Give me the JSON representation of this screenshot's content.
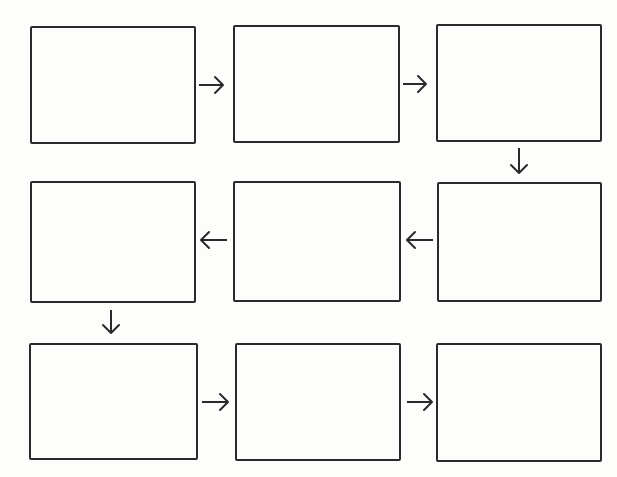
{
  "diagram": {
    "type": "flowchart",
    "layout": "3x3 serpentine grid",
    "stroke_color": "#2a2a2a",
    "background_color": "#fdfdfb",
    "boxes": [
      {
        "id": 1,
        "row": 1,
        "col": 1,
        "label": "",
        "x": 30,
        "y": 26,
        "w": 166,
        "h": 118
      },
      {
        "id": 2,
        "row": 1,
        "col": 2,
        "label": "",
        "x": 233,
        "y": 25,
        "w": 167,
        "h": 118
      },
      {
        "id": 3,
        "row": 1,
        "col": 3,
        "label": "",
        "x": 436,
        "y": 24,
        "w": 166,
        "h": 118
      },
      {
        "id": 4,
        "row": 2,
        "col": 1,
        "label": "",
        "x": 30,
        "y": 181,
        "w": 166,
        "h": 122
      },
      {
        "id": 5,
        "row": 2,
        "col": 2,
        "label": "",
        "x": 233,
        "y": 181,
        "w": 168,
        "h": 121
      },
      {
        "id": 6,
        "row": 2,
        "col": 3,
        "label": "",
        "x": 437,
        "y": 182,
        "w": 165,
        "h": 120
      },
      {
        "id": 7,
        "row": 3,
        "col": 1,
        "label": "",
        "x": 29,
        "y": 343,
        "w": 169,
        "h": 117
      },
      {
        "id": 8,
        "row": 3,
        "col": 2,
        "label": "",
        "x": 235,
        "y": 343,
        "w": 166,
        "h": 118
      },
      {
        "id": 9,
        "row": 3,
        "col": 3,
        "label": "",
        "x": 436,
        "y": 343,
        "w": 166,
        "h": 119
      }
    ],
    "arrows": [
      {
        "from": 1,
        "to": 2,
        "direction": "right",
        "x1": 199,
        "y1": 85,
        "x2": 223,
        "y2": 85
      },
      {
        "from": 2,
        "to": 3,
        "direction": "right",
        "x1": 403,
        "y1": 84,
        "x2": 426,
        "y2": 84
      },
      {
        "from": 3,
        "to": 6,
        "direction": "down",
        "x1": 519,
        "y1": 148,
        "x2": 519,
        "y2": 173
      },
      {
        "from": 6,
        "to": 5,
        "direction": "left",
        "x1": 433,
        "y1": 240,
        "x2": 407,
        "y2": 240
      },
      {
        "from": 5,
        "to": 4,
        "direction": "left",
        "x1": 227,
        "y1": 240,
        "x2": 201,
        "y2": 240
      },
      {
        "from": 4,
        "to": 7,
        "direction": "down",
        "x1": 111,
        "y1": 310,
        "x2": 111,
        "y2": 333
      },
      {
        "from": 7,
        "to": 8,
        "direction": "right",
        "x1": 202,
        "y1": 402,
        "x2": 228,
        "y2": 402
      },
      {
        "from": 8,
        "to": 9,
        "direction": "right",
        "x1": 407,
        "y1": 402,
        "x2": 432,
        "y2": 402
      }
    ]
  }
}
